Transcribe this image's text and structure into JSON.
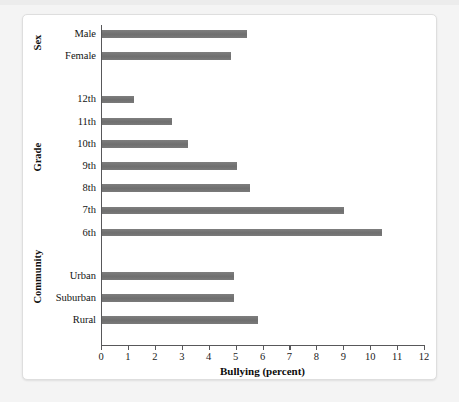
{
  "chart_data": {
    "type": "bar",
    "orientation": "horizontal",
    "title": "",
    "xlabel": "Bullying (percent)",
    "ylabel": "",
    "xlim": [
      0,
      12
    ],
    "xticks": [
      "0",
      "1",
      "2",
      "3",
      "4",
      "5",
      "6",
      "7",
      "8",
      "9",
      "10",
      "11",
      "12"
    ],
    "grid": false,
    "legend": null,
    "bar_color": "#767676",
    "axis_color": "#58585a",
    "groups": [
      {
        "name": "Sex",
        "categories": [
          "Male",
          "Female"
        ],
        "values": [
          5.4,
          4.8
        ]
      },
      {
        "name": "Grade",
        "categories": [
          "12th",
          "11th",
          "10th",
          "9th",
          "8th",
          "7th",
          "6th"
        ],
        "values": [
          1.2,
          2.6,
          3.2,
          5.0,
          5.5,
          9.0,
          10.4
        ]
      },
      {
        "name": "Community",
        "categories": [
          "Urban",
          "Suburban",
          "Rural"
        ],
        "values": [
          4.9,
          4.9,
          5.8
        ]
      }
    ],
    "categories": [
      "Male",
      "Female",
      "12th",
      "11th",
      "10th",
      "9th",
      "8th",
      "7th",
      "6th",
      "Urban",
      "Suburban",
      "Rural"
    ],
    "values": [
      5.4,
      4.8,
      1.2,
      2.6,
      3.2,
      5.0,
      5.5,
      9.0,
      10.4,
      4.9,
      4.9,
      5.8
    ]
  },
  "axis": {
    "x_title": "Bullying (percent)"
  }
}
